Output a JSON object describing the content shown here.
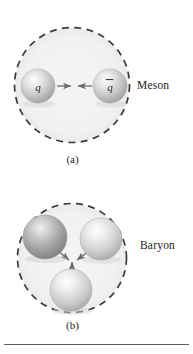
{
  "figure": {
    "type": "physics-diagram",
    "background_color": "#ffffff",
    "rule_color": "#5d5d5d"
  },
  "panels": [
    {
      "id": "a",
      "caption": "(a)",
      "side_label": "Baryon_placeholder_unused",
      "label": "Meson",
      "confinement_circle": {
        "center_x": 72,
        "center_y": 85,
        "radius": 58,
        "fill": "#f2f2f2",
        "dash_color": "#3a3a3a",
        "style": "dashed"
      },
      "particles": [
        {
          "name": "quark",
          "label": "q",
          "overbar": false,
          "cx": 38,
          "cy": 86,
          "r": 17,
          "tone": "light"
        },
        {
          "name": "antiquark",
          "label": "q",
          "overbar": true,
          "cx": 110,
          "cy": 86,
          "r": 17,
          "tone": "light"
        }
      ],
      "arrows": [
        {
          "name": "force-arrow-right",
          "from_x": 57,
          "from_y": 86,
          "to_x": 72,
          "to_y": 86
        },
        {
          "name": "force-arrow-left",
          "from_x": 91,
          "from_y": 86,
          "to_x": 76,
          "to_y": 86
        }
      ]
    },
    {
      "id": "b",
      "caption": "(b)",
      "label": "Baryon",
      "confinement_circle": {
        "center_x": 72,
        "center_y": 81,
        "radius": 55,
        "fill": "#f2f2f2",
        "dash_color": "#3a3a3a",
        "style": "dashed"
      },
      "particles": [
        {
          "name": "quark-upper-left",
          "label": "",
          "overbar": false,
          "cx": 45,
          "cy": 60,
          "r": 22,
          "tone": "dark"
        },
        {
          "name": "quark-upper-right",
          "label": "",
          "overbar": false,
          "cx": 101,
          "cy": 62,
          "r": 21,
          "tone": "light"
        },
        {
          "name": "quark-bottom",
          "label": "",
          "overbar": false,
          "cx": 71,
          "cy": 113,
          "r": 21,
          "tone": "light"
        }
      ],
      "arrows": [
        {
          "name": "force-arrow-from-upper-left",
          "from_x": 58,
          "from_y": 74,
          "to_x": 71,
          "to_y": 85
        },
        {
          "name": "force-arrow-from-upper-right",
          "from_x": 88,
          "from_y": 75,
          "to_x": 76,
          "to_y": 85
        },
        {
          "name": "force-arrow-from-bottom",
          "from_x": 72,
          "from_y": 98,
          "to_x": 72,
          "to_y": 85
        }
      ]
    }
  ]
}
